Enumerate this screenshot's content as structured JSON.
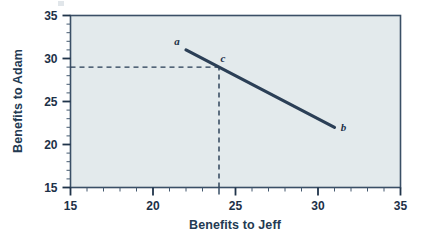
{
  "chart_data": {
    "type": "line",
    "title": "",
    "xlabel": "Benefits to Jeff",
    "ylabel": "Benefits to Adam",
    "xlim": [
      15,
      35
    ],
    "ylim": [
      15,
      35
    ],
    "xticks": [
      15,
      20,
      25,
      30,
      35
    ],
    "xtick_labels": [
      "15",
      "20",
      "25",
      "30",
      "35"
    ],
    "yticks": [
      15,
      20,
      25,
      30,
      35
    ],
    "ytick_labels": [
      "15",
      "20",
      "25",
      "30",
      "35"
    ],
    "minor_tick_step": 1,
    "grid": false,
    "legend": null,
    "plot_background": "#e3eaec",
    "line_color": "#2b3f56",
    "series": [
      {
        "name": "bargaining-frontier",
        "points": [
          {
            "x": 22,
            "y": 31,
            "label": "a"
          },
          {
            "x": 31,
            "y": 22,
            "label": "b"
          }
        ]
      }
    ],
    "annotations": [
      {
        "label": "a",
        "x": 22,
        "y": 31,
        "dx": -9,
        "dy": -5
      },
      {
        "label": "c",
        "x": 24,
        "y": 29,
        "dx": 4,
        "dy": -5
      },
      {
        "label": "b",
        "x": 31,
        "y": 22,
        "dx": 9,
        "dy": 4
      }
    ],
    "guide_lines": [
      {
        "name": "horizontal-guide-to-c",
        "orientation": "horizontal",
        "value": 29,
        "from": 15,
        "to": 24,
        "style": "dashed"
      },
      {
        "name": "vertical-guide-to-c",
        "orientation": "vertical",
        "value": 24,
        "from": 15,
        "to": 29,
        "style": "dashed"
      }
    ],
    "emphasized_xticks": [
      24
    ]
  },
  "labels": {
    "x_axis_title": "Benefits to Jeff",
    "y_axis_title": "Benefits to Adam",
    "point_a": "a",
    "point_b": "b",
    "point_c": "c",
    "x_15": "15",
    "x_20": "20",
    "x_25": "25",
    "x_30": "30",
    "x_35": "35",
    "y_15": "15",
    "y_20": "20",
    "y_25": "25",
    "y_30": "30",
    "y_35": "35"
  }
}
